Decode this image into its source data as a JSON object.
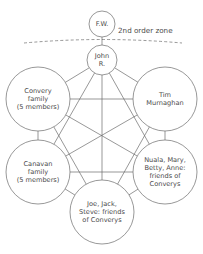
{
  "diagram": {
    "stroke_color": "#6b6b6b",
    "text_color": "#4a4a4a",
    "background_color": "#ffffff",
    "zone_label": "2nd order zone",
    "nodes": [
      {
        "id": "fw",
        "lines": [
          "F.W."
        ],
        "cx": 102,
        "cy": 24,
        "r": 13,
        "font_size": 6.6,
        "line_height": 7.6
      },
      {
        "id": "john-r",
        "lines": [
          "John",
          "R."
        ],
        "cx": 102,
        "cy": 60,
        "r": 15,
        "font_size": 6.6,
        "line_height": 7.6
      },
      {
        "id": "convery-family",
        "lines": [
          "Convery",
          "family",
          "(5 members)"
        ],
        "cx": 38,
        "cy": 99,
        "r": 32,
        "font_size": 6.6,
        "line_height": 8.2
      },
      {
        "id": "tim-murnaghan",
        "lines": [
          "Tim",
          "Murnaghan"
        ],
        "cx": 165,
        "cy": 99,
        "r": 32,
        "font_size": 6.6,
        "line_height": 8.2
      },
      {
        "id": "canavan-family",
        "lines": [
          "Canavan",
          "family",
          "(5 members)"
        ],
        "cx": 38,
        "cy": 172,
        "r": 32,
        "font_size": 6.6,
        "line_height": 8.2
      },
      {
        "id": "nuala-mary-betty-anne",
        "lines": [
          "Nuala, Mary,",
          "Betty, Anne:",
          "friends of",
          "Converys"
        ],
        "cx": 165,
        "cy": 172,
        "r": 32,
        "font_size": 6.6,
        "line_height": 8.2
      },
      {
        "id": "joe-jack-steve",
        "lines": [
          "Joe, Jack,",
          "Steve: friends",
          "of Converys"
        ],
        "cx": 102,
        "cy": 212,
        "r": 32,
        "font_size": 6.6,
        "line_height": 8.2
      }
    ],
    "edges": [
      {
        "from": "fw",
        "to": "john-r"
      },
      {
        "from": "john-r",
        "to": "convery-family"
      },
      {
        "from": "john-r",
        "to": "tim-murnaghan"
      },
      {
        "from": "john-r",
        "to": "canavan-family"
      },
      {
        "from": "john-r",
        "to": "nuala-mary-betty-anne"
      },
      {
        "from": "john-r",
        "to": "joe-jack-steve"
      },
      {
        "from": "convery-family",
        "to": "tim-murnaghan"
      },
      {
        "from": "convery-family",
        "to": "canavan-family"
      },
      {
        "from": "convery-family",
        "to": "nuala-mary-betty-anne"
      },
      {
        "from": "convery-family",
        "to": "joe-jack-steve"
      },
      {
        "from": "tim-murnaghan",
        "to": "canavan-family"
      },
      {
        "from": "tim-murnaghan",
        "to": "nuala-mary-betty-anne"
      },
      {
        "from": "tim-murnaghan",
        "to": "joe-jack-steve"
      },
      {
        "from": "canavan-family",
        "to": "nuala-mary-betty-anne"
      },
      {
        "from": "canavan-family",
        "to": "joe-jack-steve"
      },
      {
        "from": "nuala-mary-betty-anne",
        "to": "joe-jack-steve"
      }
    ],
    "zone_divider": {
      "start_x": 24,
      "start_y": 43,
      "control_x": 102,
      "control_y": 36,
      "end_x": 182,
      "end_y": 43
    },
    "zone_label_position": {
      "x": 118,
      "y": 31
    }
  }
}
